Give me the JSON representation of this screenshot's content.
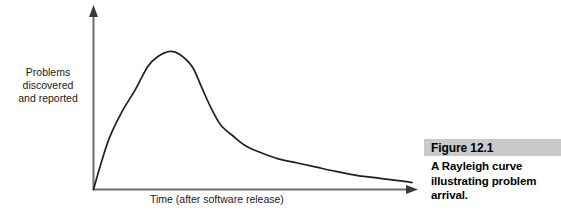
{
  "figure": {
    "number": "Figure 12.1",
    "caption": "A Rayleigh curve illustrating problem arrival.",
    "highlight_color": "#c9c9c9"
  },
  "chart_data": {
    "type": "line",
    "title": "",
    "subtitle": "",
    "xlabel": "Time (after software release)",
    "ylabel": "Problems\ndiscovered\nand reported",
    "ylabel_lines": [
      "Problems",
      "discovered",
      "and reported"
    ],
    "legend": [],
    "legend_position": "none",
    "grid": false,
    "axis_arrows": true,
    "tick_labels_x": [],
    "tick_labels_y": [],
    "xlim": [
      0,
      100
    ],
    "ylim": [
      0,
      100
    ],
    "line_color": "#231f20",
    "axis_color": "#6e6e6e",
    "series": [
      {
        "name": "Problems discovered and reported",
        "description": "Rayleigh curve: rises steeply from the origin, peaks near 24% of the time axis, then decays with a long tail toward zero.",
        "x": [
          0,
          2,
          5,
          9,
          13,
          17,
          20,
          24,
          27,
          31,
          34,
          37,
          40,
          44,
          48,
          53,
          58,
          64,
          70,
          76,
          83,
          90,
          97,
          100
        ],
        "y": [
          0,
          16,
          37,
          56,
          71,
          88,
          95,
          99,
          97,
          88,
          73,
          58,
          46,
          38,
          31,
          26,
          22,
          19,
          16,
          13,
          10,
          8,
          6,
          5
        ]
      }
    ]
  }
}
